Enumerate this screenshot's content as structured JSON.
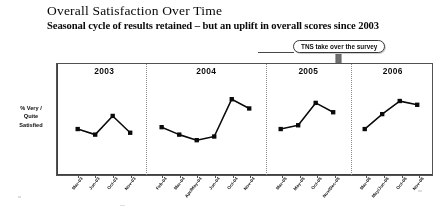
{
  "slide": {
    "title": "Overall Satisfaction Over Time",
    "subtitle": "Seasonal cycle of results retained – but an uplift in overall scores since 2003"
  },
  "callout": {
    "text": "TNS take over the survey",
    "arrow_icon": "down-arrow-icon",
    "arrow_color": "#6b6b6b"
  },
  "axis": {
    "y_caption_line1": "% Very /",
    "y_caption_line2": "Quite",
    "y_caption_line3": "Satisfied"
  },
  "chart_data": {
    "type": "line",
    "title": "Overall Satisfaction Over Time",
    "xlabel": "",
    "ylabel": "% Very / Quite Satisfied",
    "grid": false,
    "legend": "none",
    "ylim": [
      0,
      100
    ],
    "marker": "square",
    "line_color": "#111111",
    "marker_color": "#111111",
    "panels": [
      {
        "year": "2003",
        "categories": [
          "Mar-03",
          "Jun-03",
          "Oct-03",
          "Nov-03"
        ],
        "values": [
          55,
          52,
          62,
          53
        ]
      },
      {
        "year": "2004",
        "categories": [
          "Feb-04",
          "Mar-04",
          "Apr/May-04",
          "Jun-04",
          "Oct-04",
          "Nov-04"
        ],
        "values": [
          56,
          52,
          49,
          51,
          71,
          66
        ]
      },
      {
        "year": "2005",
        "categories": [
          "Mar-05",
          "May-05",
          "Oct-05",
          "Nov/Dec-05"
        ],
        "values": [
          55,
          57,
          69,
          64
        ]
      },
      {
        "year": "2006",
        "categories": [
          "Mar-06",
          "May/Jun-06",
          "Oct-06",
          "Nov-06"
        ],
        "values": [
          55,
          63,
          70,
          68
        ]
      }
    ],
    "annotations": [
      {
        "text": "TNS take over the survey",
        "at": "between 2005 and 2006"
      }
    ]
  }
}
